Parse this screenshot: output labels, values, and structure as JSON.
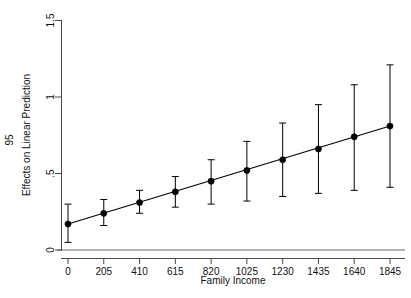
{
  "chart_data": {
    "type": "scatter",
    "title": "",
    "subtitle": "",
    "xlabel": "Family Income",
    "ylabel": "Effects on Linear Prediction",
    "ci_label": "95",
    "x": [
      0,
      205,
      410,
      615,
      820,
      1025,
      1230,
      1435,
      1640,
      1845
    ],
    "xticklabels": [
      "0",
      "205",
      "410",
      "615",
      "820",
      "1025",
      "1230",
      "1435",
      "1640",
      "1845"
    ],
    "yticklabels": [
      "0",
      ".5",
      "1",
      "1.5"
    ],
    "yticks": [
      0,
      0.5,
      1,
      1.5
    ],
    "xlim": [
      -80,
      1925
    ],
    "ylim": [
      0,
      1.5
    ],
    "grid": false,
    "legend": "none",
    "series": [
      {
        "name": "Effects on Linear Prediction",
        "values": [
          0.17,
          0.24,
          0.31,
          0.38,
          0.45,
          0.52,
          0.59,
          0.66,
          0.74,
          0.81
        ],
        "ci_low": [
          0.05,
          0.16,
          0.24,
          0.28,
          0.3,
          0.32,
          0.35,
          0.37,
          0.39,
          0.41
        ],
        "ci_high": [
          0.3,
          0.33,
          0.39,
          0.48,
          0.59,
          0.71,
          0.83,
          0.95,
          1.08,
          1.21
        ]
      }
    ],
    "reference_line": {
      "axis": "y",
      "value": 0,
      "color": "#9a9a9a"
    },
    "fit_line": {
      "from": [
        0,
        0.17
      ],
      "to": [
        1845,
        0.81
      ],
      "color": "#000000"
    },
    "colors": {
      "marker": "#000000",
      "error_bar": "#000000",
      "axis": "#4d4d4d",
      "reference": "#9a9a9a",
      "background": "#ffffff"
    }
  }
}
